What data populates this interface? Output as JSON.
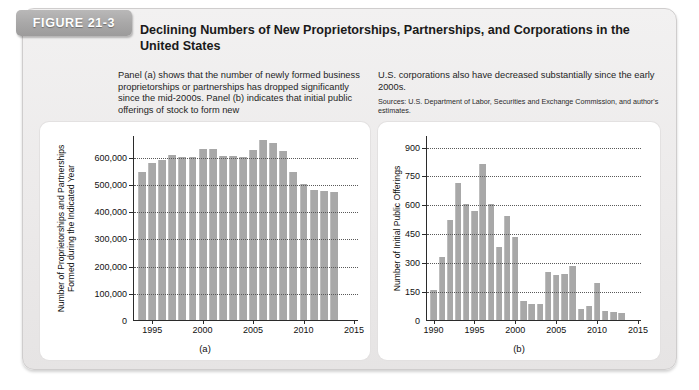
{
  "figure": {
    "tab_label": "FIGURE 21-3",
    "title": "Declining Numbers of New Proprietorships, Partnerships, and Corporations in the United States",
    "caption_left": "Panel (a) shows that the number of newly formed business proprietorships or partnerships has dropped significantly since the mid-2000s. Panel (b) indicates that initial public offerings of stock to form new",
    "caption_right": "U.S. corporations also have decreased substantially since the early 2000s.",
    "sources": "Sources: U.S. Department of Labor, Securities and Exchange Commission, and author's estimates.",
    "bar_color": "#a8a8a8",
    "panel_a_label": "(a)",
    "panel_b_label": "(b)"
  },
  "chart_data": [
    {
      "type": "bar",
      "panel": "(a)",
      "title": "",
      "xlabel": "",
      "ylabel": "Number of Proprietorships and Partnerships Formed during the Indicated Year",
      "ylim": [
        0,
        680000
      ],
      "yticks": [
        0,
        100000,
        200000,
        300000,
        400000,
        500000,
        600000
      ],
      "ytick_labels": [
        "0",
        "100,000",
        "200,000",
        "300,000",
        "400,000",
        "500,000",
        "600,000"
      ],
      "xlim": [
        1993.2,
        2015.5
      ],
      "xticks": [
        1995,
        2000,
        2005,
        2010,
        2015
      ],
      "xtick_labels": [
        "1995",
        "2000",
        "2005",
        "2010",
        "2015"
      ],
      "grid": true,
      "categories": [
        1994,
        1995,
        1996,
        1997,
        1998,
        1999,
        2000,
        2001,
        2002,
        2003,
        2004,
        2005,
        2006,
        2007,
        2008,
        2009,
        2010,
        2011,
        2012,
        2013
      ],
      "values": [
        545000,
        578000,
        588000,
        608000,
        600000,
        600000,
        628000,
        630000,
        604000,
        604000,
        600000,
        625000,
        663000,
        650000,
        620000,
        545000,
        500000,
        478000,
        475000,
        470000
      ]
    },
    {
      "type": "bar",
      "panel": "(b)",
      "title": "",
      "xlabel": "",
      "ylabel": "Number of Initial Public Offerings",
      "ylim": [
        0,
        960
      ],
      "yticks": [
        0,
        150,
        300,
        450,
        600,
        750,
        900
      ],
      "ytick_labels": [
        "0",
        "150",
        "300",
        "450",
        "600",
        "750",
        "900"
      ],
      "xlim": [
        1989.2,
        2015.5
      ],
      "xticks": [
        1990,
        1995,
        2000,
        2005,
        2010,
        2015
      ],
      "xtick_labels": [
        "1990",
        "1995",
        "2000",
        "2005",
        "2010",
        "2015"
      ],
      "grid": true,
      "categories": [
        1990,
        1991,
        1992,
        1993,
        1994,
        1995,
        1996,
        1997,
        1998,
        1999,
        2000,
        2001,
        2002,
        2003,
        2004,
        2005,
        2006,
        2007,
        2008,
        2009,
        2010,
        2011,
        2012,
        2013
      ],
      "values": [
        155,
        325,
        520,
        710,
        600,
        565,
        810,
        600,
        380,
        540,
        430,
        97,
        85,
        85,
        250,
        235,
        240,
        280,
        55,
        75,
        190,
        45,
        40,
        35
      ]
    }
  ]
}
